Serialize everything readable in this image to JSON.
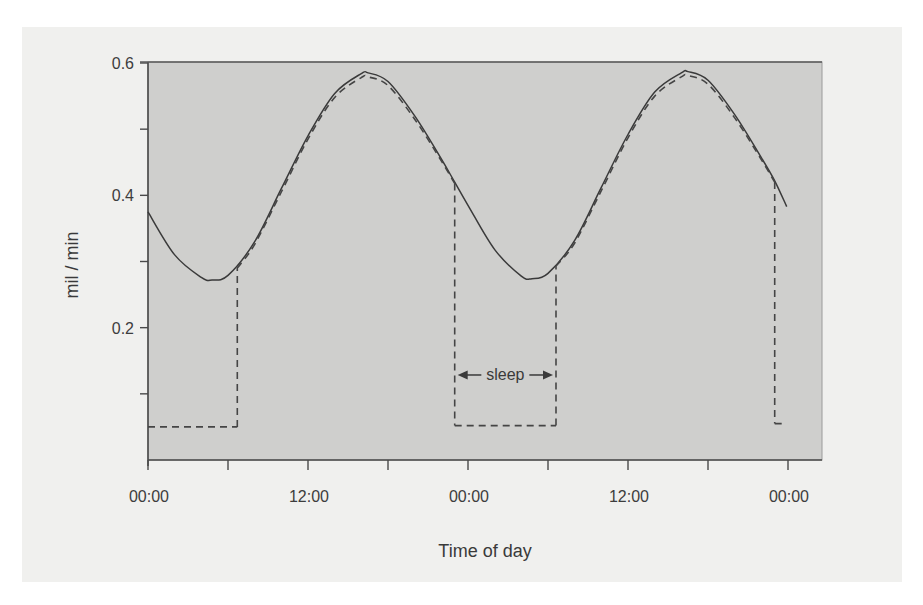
{
  "chart_data": {
    "type": "line",
    "title": "",
    "xlabel": "Time of day",
    "ylabel": "mil / min",
    "x_unit": "hours since first midnight",
    "xlim": [
      0,
      50.5
    ],
    "ylim": [
      0,
      0.6
    ],
    "x_ticks": [
      0,
      6,
      12,
      18,
      24,
      30,
      36,
      42,
      48
    ],
    "x_tick_labels": [
      {
        "x": 0,
        "label": "00:00"
      },
      {
        "x": 12,
        "label": "12:00"
      },
      {
        "x": 24,
        "label": "00:00"
      },
      {
        "x": 36,
        "label": "12:00"
      },
      {
        "x": 48,
        "label": "00:00"
      }
    ],
    "y_ticks": [
      0.1,
      0.2,
      0.3,
      0.4,
      0.5,
      0.6
    ],
    "y_tick_labels": [
      {
        "y": 0.2,
        "label": "0.2"
      },
      {
        "y": 0.4,
        "label": "0.4"
      },
      {
        "y": 0.6,
        "label": "0.6"
      }
    ],
    "grid": false,
    "legend": null,
    "series": [
      {
        "name": "circadian rhythm (solid)",
        "style": "solid",
        "x": [
          0,
          2,
          4,
          4.8,
          6,
          8,
          10,
          12,
          14,
          16,
          16.5,
          18,
          20,
          22,
          23,
          24,
          26,
          28,
          28.8,
          30,
          32,
          34,
          36,
          38,
          40,
          40.5,
          42,
          44,
          46,
          47,
          47.9
        ],
        "y": [
          0.375,
          0.31,
          0.276,
          0.272,
          0.279,
          0.33,
          0.41,
          0.49,
          0.554,
          0.584,
          0.585,
          0.572,
          0.52,
          0.455,
          0.42,
          0.385,
          0.318,
          0.278,
          0.274,
          0.282,
          0.332,
          0.412,
          0.492,
          0.556,
          0.585,
          0.587,
          0.574,
          0.522,
          0.457,
          0.422,
          0.383
        ]
      },
      {
        "name": "observed level (dashed)",
        "style": "dashed",
        "x": [
          0,
          6.7,
          6.7,
          8,
          10,
          12,
          14,
          16,
          16.5,
          18,
          20,
          22,
          23,
          23,
          30.6,
          30.6,
          32,
          34,
          36,
          38,
          40,
          40.5,
          42,
          44,
          46,
          47,
          47,
          47.6
        ],
        "y": [
          0.05,
          0.05,
          0.29,
          0.326,
          0.405,
          0.485,
          0.548,
          0.578,
          0.579,
          0.566,
          0.515,
          0.452,
          0.418,
          0.052,
          0.052,
          0.293,
          0.328,
          0.407,
          0.487,
          0.55,
          0.579,
          0.581,
          0.568,
          0.517,
          0.454,
          0.42,
          0.055,
          0.055
        ]
      }
    ],
    "annotations": [
      {
        "text": "sleep",
        "x_start": 23,
        "x_end": 30.6,
        "y": 0.13,
        "arrows": "both"
      }
    ]
  }
}
